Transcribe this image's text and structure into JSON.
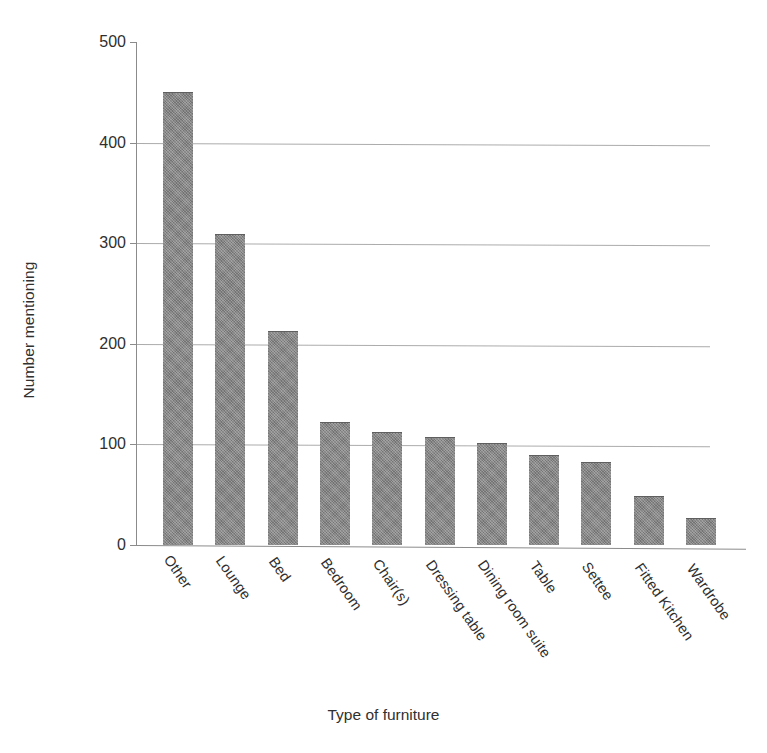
{
  "chart_data": {
    "type": "bar",
    "title": "",
    "subtitle": "",
    "xlabel": "Type of furniture",
    "ylabel": "Number mentioning",
    "categories": [
      "Other",
      "Lounge",
      "Bed",
      "Bedroom",
      "Chair(s)",
      "Dressing table",
      "Dining room suite",
      "Table",
      "Settee",
      "Fitted Kitchen",
      "Wardrobe"
    ],
    "values": [
      450,
      309,
      213,
      122,
      112,
      107,
      101,
      89,
      83,
      49,
      27
    ],
    "ylim": [
      0,
      500
    ],
    "yticks": [
      0,
      100,
      200,
      300,
      400,
      500
    ],
    "ytick_labels": [
      "0",
      "100",
      "200",
      "300",
      "400",
      "500"
    ],
    "grid": "horizontal",
    "legend": "none",
    "bar_color": "#818181",
    "grid_color": "#9d9d9d",
    "axis_color": "#8b8b8b",
    "background": "#ffffff"
  }
}
